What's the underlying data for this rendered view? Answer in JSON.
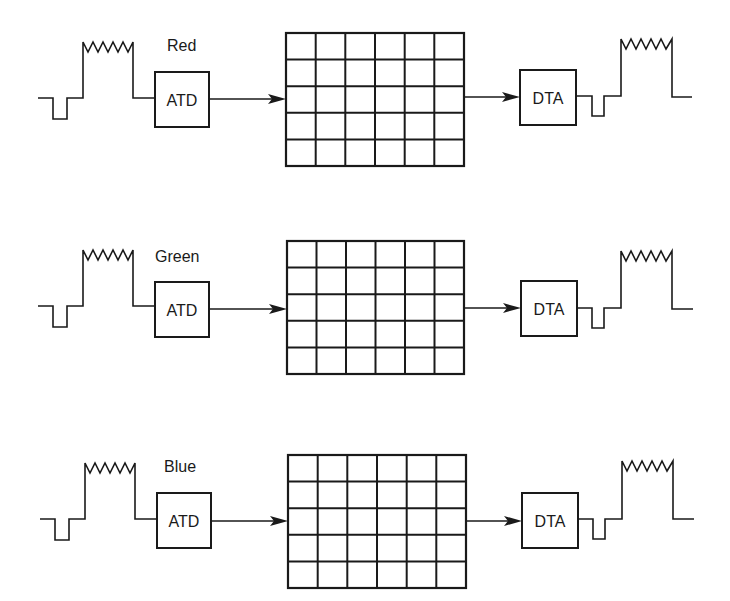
{
  "diagram": {
    "title": "",
    "channels": [
      {
        "name": "Red",
        "offset_y": 0,
        "input_block": "ATD",
        "output_block": "DTA"
      },
      {
        "name": "Green",
        "offset_y": 208,
        "input_block": "ATD",
        "output_block": "DTA"
      },
      {
        "name": "Blue",
        "offset_y": 421,
        "input_block": "ATD",
        "output_block": "DTA"
      }
    ],
    "grid": {
      "columns": 6,
      "rows": 5
    },
    "colors": {
      "stroke": "#1a1a1a",
      "background": "#ffffff"
    }
  }
}
